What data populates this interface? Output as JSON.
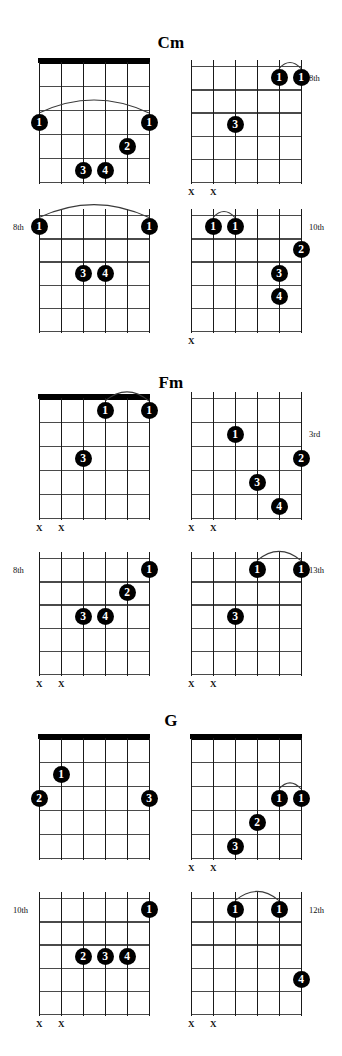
{
  "page": {
    "width": 342,
    "height": 1056,
    "background": "#ffffff",
    "ink": "#000000",
    "dot_fill": "#000000",
    "dot_text": "#ffffff",
    "fret_color": "#4a4a4a",
    "string_color": "#1a1a1a"
  },
  "labels": {
    "mute_symbol": "X",
    "fret_8th": "8th",
    "fret_10th": "10th",
    "fret_3rd": "3rd",
    "fret_13th": "13th",
    "fret_12th": "12th"
  },
  "sections": [
    {
      "id": "cm",
      "title": "Cm",
      "title_y": 33,
      "top": 0,
      "diagrams": [
        {
          "id": "cm-1",
          "name": "cm-voicing-1",
          "x": 39,
          "y": 62,
          "w": 110,
          "h": 120,
          "strings": 6,
          "frets": 5,
          "open_nut": true,
          "position_label": "",
          "position_side": "",
          "mutes": [],
          "dots": [
            {
              "finger": "1",
              "string": 6,
              "fret": 3
            },
            {
              "finger": "1",
              "string": 1,
              "fret": 3
            },
            {
              "finger": "2",
              "string": 2,
              "fret": 4
            },
            {
              "finger": "3",
              "string": 4,
              "fret": 5
            },
            {
              "finger": "4",
              "string": 3,
              "fret": 5
            }
          ],
          "barre": {
            "from_string": 6,
            "to_string": 1,
            "fret": 3
          }
        },
        {
          "id": "cm-2",
          "name": "cm-voicing-2",
          "x": 191,
          "y": 66,
          "w": 110,
          "h": 116,
          "strings": 6,
          "frets": 5,
          "open_nut": false,
          "position_label": "8th",
          "position_side": "right",
          "position_fret": 1,
          "mutes": [
            6,
            5
          ],
          "dots": [
            {
              "finger": "1",
              "string": 2,
              "fret": 1
            },
            {
              "finger": "1",
              "string": 1,
              "fret": 1
            },
            {
              "finger": "3",
              "string": 4,
              "fret": 3
            }
          ],
          "barre": {
            "from_string": 2,
            "to_string": 1,
            "fret": 1
          }
        },
        {
          "id": "cm-3",
          "name": "cm-voicing-3",
          "x": 39,
          "y": 215,
          "w": 110,
          "h": 116,
          "strings": 6,
          "frets": 5,
          "open_nut": false,
          "position_label": "8th",
          "position_side": "left",
          "position_fret": 1,
          "mutes": [],
          "dots": [
            {
              "finger": "1",
              "string": 6,
              "fret": 1
            },
            {
              "finger": "1",
              "string": 1,
              "fret": 1
            },
            {
              "finger": "3",
              "string": 4,
              "fret": 3
            },
            {
              "finger": "4",
              "string": 3,
              "fret": 3
            }
          ],
          "barre": {
            "from_string": 6,
            "to_string": 1,
            "fret": 1
          }
        },
        {
          "id": "cm-4",
          "name": "cm-voicing-4",
          "x": 191,
          "y": 215,
          "w": 110,
          "h": 116,
          "strings": 6,
          "frets": 5,
          "open_nut": false,
          "position_label": "10th",
          "position_side": "right",
          "position_fret": 1,
          "mutes": [
            6
          ],
          "dots": [
            {
              "finger": "1",
              "string": 5,
              "fret": 1
            },
            {
              "finger": "1",
              "string": 4,
              "fret": 1
            },
            {
              "finger": "2",
              "string": 1,
              "fret": 2
            },
            {
              "finger": "3",
              "string": 2,
              "fret": 3
            },
            {
              "finger": "4",
              "string": 2,
              "fret": 4,
              "shift": 1
            }
          ],
          "barre": {
            "from_string": 5,
            "to_string": 4,
            "fret": 1
          }
        }
      ]
    },
    {
      "id": "fm",
      "title": "Fm",
      "title_y": 373,
      "top": 0,
      "diagrams": [
        {
          "id": "fm-1",
          "name": "fm-voicing-1",
          "x": 39,
          "y": 398,
          "w": 110,
          "h": 120,
          "strings": 6,
          "frets": 5,
          "open_nut": true,
          "position_label": "",
          "position_side": "",
          "mutes": [
            6,
            5
          ],
          "dots": [
            {
              "finger": "1",
              "string": 3,
              "fret": 1
            },
            {
              "finger": "1",
              "string": 1,
              "fret": 1
            },
            {
              "finger": "3",
              "string": 4,
              "fret": 3
            }
          ],
          "barre": {
            "from_string": 3,
            "to_string": 1,
            "fret": 1
          }
        },
        {
          "id": "fm-2",
          "name": "fm-voicing-2",
          "x": 191,
          "y": 398,
          "w": 110,
          "h": 120,
          "strings": 6,
          "frets": 5,
          "open_nut": false,
          "position_label": "3rd",
          "position_side": "right",
          "position_fret": 2,
          "mutes": [
            6,
            5
          ],
          "dots": [
            {
              "finger": "1",
              "string": 4,
              "fret": 2
            },
            {
              "finger": "2",
              "string": 1,
              "fret": 3
            },
            {
              "finger": "3",
              "string": 3,
              "fret": 4
            },
            {
              "finger": "4",
              "string": 2,
              "fret": 5
            }
          ],
          "barre": null
        },
        {
          "id": "fm-3",
          "name": "fm-voicing-3",
          "x": 39,
          "y": 558,
          "w": 110,
          "h": 116,
          "strings": 6,
          "frets": 5,
          "open_nut": false,
          "position_label": "8th",
          "position_side": "left",
          "position_fret": 1,
          "mutes": [
            6,
            5
          ],
          "dots": [
            {
              "finger": "1",
              "string": 1,
              "fret": 1
            },
            {
              "finger": "2",
              "string": 2,
              "fret": 2
            },
            {
              "finger": "3",
              "string": 4,
              "fret": 3
            },
            {
              "finger": "4",
              "string": 3,
              "fret": 3
            }
          ],
          "barre": null
        },
        {
          "id": "fm-4",
          "name": "fm-voicing-4",
          "x": 191,
          "y": 558,
          "w": 110,
          "h": 116,
          "strings": 6,
          "frets": 5,
          "open_nut": false,
          "position_label": "13th",
          "position_side": "right",
          "position_fret": 1,
          "mutes": [
            6,
            5
          ],
          "dots": [
            {
              "finger": "1",
              "string": 3,
              "fret": 1
            },
            {
              "finger": "1",
              "string": 1,
              "fret": 1
            },
            {
              "finger": "3",
              "string": 4,
              "fret": 3
            }
          ],
          "barre": {
            "from_string": 3,
            "to_string": 1,
            "fret": 1
          }
        }
      ]
    },
    {
      "id": "g",
      "title": "G",
      "title_y": 711,
      "top": 0,
      "diagrams": [
        {
          "id": "g-1",
          "name": "g-voicing-1",
          "x": 39,
          "y": 738,
          "w": 110,
          "h": 120,
          "strings": 6,
          "frets": 5,
          "open_nut": true,
          "position_label": "",
          "position_side": "",
          "mutes": [],
          "dots": [
            {
              "finger": "1",
              "string": 5,
              "fret": 2
            },
            {
              "finger": "2",
              "string": 6,
              "fret": 3
            },
            {
              "finger": "3",
              "string": 1,
              "fret": 3
            }
          ],
          "barre": null
        },
        {
          "id": "g-2",
          "name": "g-voicing-2",
          "x": 191,
          "y": 738,
          "w": 110,
          "h": 120,
          "strings": 6,
          "frets": 5,
          "open_nut": true,
          "position_label": "",
          "position_side": "",
          "mutes": [
            6,
            5
          ],
          "dots": [
            {
              "finger": "1",
              "string": 2,
              "fret": 3
            },
            {
              "finger": "1",
              "string": 1,
              "fret": 3
            },
            {
              "finger": "2",
              "string": 3,
              "fret": 4
            },
            {
              "finger": "3",
              "string": 4,
              "fret": 5
            }
          ],
          "barre": {
            "from_string": 2,
            "to_string": 1,
            "fret": 3
          }
        },
        {
          "id": "g-3",
          "name": "g-voicing-3",
          "x": 39,
          "y": 898,
          "w": 110,
          "h": 116,
          "strings": 6,
          "frets": 5,
          "open_nut": false,
          "position_label": "10th",
          "position_side": "left",
          "position_fret": 1,
          "mutes": [
            6,
            5
          ],
          "dots": [
            {
              "finger": "1",
              "string": 1,
              "fret": 1
            },
            {
              "finger": "2",
              "string": 4,
              "fret": 3
            },
            {
              "finger": "3",
              "string": 3,
              "fret": 3
            },
            {
              "finger": "4",
              "string": 2,
              "fret": 3
            }
          ],
          "barre": null
        },
        {
          "id": "g-4",
          "name": "g-voicing-4",
          "x": 191,
          "y": 898,
          "w": 110,
          "h": 116,
          "strings": 6,
          "frets": 5,
          "open_nut": false,
          "position_label": "12th",
          "position_side": "right",
          "position_fret": 1,
          "mutes": [
            6,
            5
          ],
          "dots": [
            {
              "finger": "1",
              "string": 4,
              "fret": 1
            },
            {
              "finger": "1",
              "string": 2,
              "fret": 1
            },
            {
              "finger": "4",
              "string": 1,
              "fret": 4
            }
          ],
          "barre": {
            "from_string": 4,
            "to_string": 2,
            "fret": 1
          }
        }
      ]
    }
  ]
}
